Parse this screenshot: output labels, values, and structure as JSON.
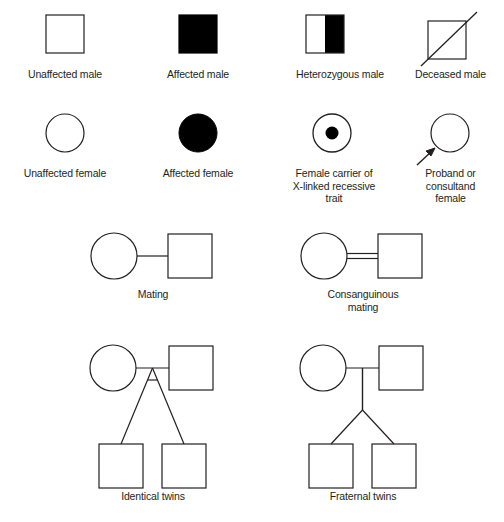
{
  "figure": {
    "kind": "pedigree-symbol-legend",
    "background_color": "#ffffff",
    "line_color": "#231f20",
    "fill_affected_color": "#000000",
    "fill_unaffected_color": "#ffffff"
  },
  "rows": [
    {
      "row_name": "male-symbols",
      "items": [
        {
          "key": "unaffected-male",
          "caption": "Unaffected male",
          "shape": "square",
          "fill": "none"
        },
        {
          "key": "affected-male",
          "caption": "Affected male",
          "shape": "square",
          "fill": "solid"
        },
        {
          "key": "heterozygous-male",
          "caption": "Heterozygous male",
          "shape": "square",
          "fill": "half-right"
        },
        {
          "key": "deceased-male",
          "caption": "Deceased male",
          "shape": "square",
          "fill": "none",
          "overlay": "slash"
        }
      ]
    },
    {
      "row_name": "female-symbols",
      "items": [
        {
          "key": "unaffected-female",
          "caption": "Unaffected female",
          "shape": "circle",
          "fill": "none"
        },
        {
          "key": "affected-female",
          "caption": "Affected female",
          "shape": "circle",
          "fill": "solid"
        },
        {
          "key": "carrier-female",
          "caption": "Female carrier of\nX-linked recessive\ntrait",
          "shape": "circle",
          "fill": "center-dot"
        },
        {
          "key": "proband-female",
          "caption": "Proband or\nconsultand\nfemale",
          "shape": "circle",
          "fill": "none",
          "overlay": "arrow"
        }
      ]
    },
    {
      "row_name": "mating-lines",
      "items": [
        {
          "key": "mating",
          "caption": "Mating",
          "line": "single"
        },
        {
          "key": "consanguinous-mating",
          "caption": "Consanguinous\nmating",
          "line": "double"
        }
      ]
    },
    {
      "row_name": "twin-pedigrees",
      "items": [
        {
          "key": "identical-twins",
          "caption": "Identical twins",
          "twin": "monozygotic"
        },
        {
          "key": "fraternal-twins",
          "caption": "Fraternal twins",
          "twin": "dizygotic"
        }
      ]
    }
  ]
}
